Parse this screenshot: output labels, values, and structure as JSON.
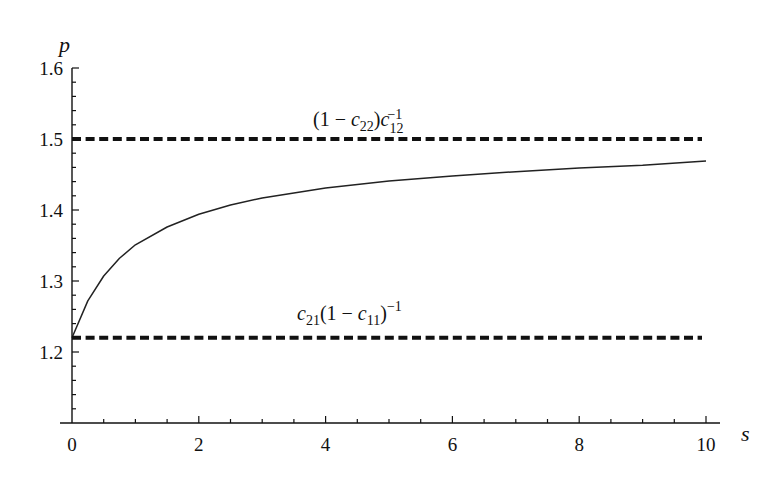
{
  "chart_data": {
    "type": "line",
    "title": "",
    "xlabel": "s",
    "ylabel": "p",
    "xlim": [
      0,
      10
    ],
    "ylim": [
      1.1,
      1.6
    ],
    "x_ticks": [
      0,
      2,
      4,
      6,
      8,
      10
    ],
    "x_tick_labels": [
      "0",
      "2",
      "4",
      "6",
      "8",
      "10"
    ],
    "x_minor_step": 0.5,
    "y_ticks": [
      1.2,
      1.3,
      1.4,
      1.5,
      1.6
    ],
    "y_tick_labels": [
      "1.2",
      "1.3",
      "1.4",
      "1.5",
      "1.6"
    ],
    "y_minor_step": 0.02,
    "grid": false,
    "legend": null,
    "series": [
      {
        "name": "p(s)",
        "style": "solid",
        "x": [
          0,
          0.25,
          0.5,
          0.75,
          1,
          1.5,
          2,
          2.5,
          3,
          4,
          5,
          6,
          7,
          8,
          9,
          10
        ],
        "values": [
          1.22,
          1.272,
          1.307,
          1.332,
          1.351,
          1.376,
          1.394,
          1.407,
          1.417,
          1.431,
          1.441,
          1.448,
          1.454,
          1.459,
          1.463,
          1.469
        ]
      },
      {
        "name": "upper bound",
        "style": "dashed",
        "x": [
          0,
          10
        ],
        "values": [
          1.5,
          1.5
        ],
        "annotation": "(1 − c22)c12^−1"
      },
      {
        "name": "lower bound",
        "style": "dashed",
        "x": [
          0,
          10
        ],
        "values": [
          1.22,
          1.22
        ],
        "annotation": "c21(1 − c11)^−1"
      }
    ]
  },
  "annotations": {
    "upper": {
      "open": "(1 − ",
      "c": "c",
      "sub1": "22",
      "close": ")",
      "c2": "c",
      "sub2": "12",
      "sup2": "−1"
    },
    "lower": {
      "c": "c",
      "sub1": "21",
      "mid": "(1 − ",
      "c2": "c",
      "sub2": "11",
      "close": ")",
      "sup2": "−1"
    }
  },
  "colors": {
    "axis": "#111111",
    "curve": "#222222",
    "dash": "#111111",
    "background": "#ffffff"
  }
}
